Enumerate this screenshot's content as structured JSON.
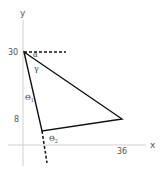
{
  "diagram": {
    "axes": {
      "x_label": "x",
      "y_label": "y",
      "color": "#c8c8c8"
    },
    "ticks": {
      "y_top": "30",
      "y_bottom": "8",
      "x_right": "36"
    },
    "angles": {
      "alpha": "α",
      "gamma": "γ",
      "theta1_symbol": "Θ",
      "theta1_sub": "1",
      "theta2_symbol": "Θ",
      "theta2_sub": "2"
    },
    "triangle": {
      "vertices": [
        {
          "name": "top",
          "x": 0,
          "y": 30
        },
        {
          "name": "right",
          "x": 36,
          "y": 8
        },
        {
          "name": "bottom",
          "x": 6,
          "y": 4
        }
      ],
      "line_color": "#111111"
    },
    "extensions": {
      "horizontal_dashed_from_top": true,
      "downward_dashed_from_bottom": true
    }
  }
}
